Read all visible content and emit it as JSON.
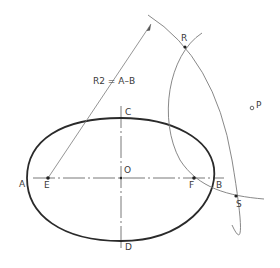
{
  "diagram": {
    "type": "ellipse-construction",
    "colors": {
      "ellipse": "#2a2a2a",
      "construction": "#7a7a7a",
      "axis": "#555555",
      "text": "#3a3a3a",
      "background": "#ffffff"
    },
    "labels": {
      "A": "A",
      "B": "B",
      "C": "C",
      "D": "D",
      "E": "E",
      "F": "F",
      "O": "O",
      "P": "P",
      "R": "R",
      "S": "S",
      "radius_note": "R2 = A–B"
    },
    "points": [
      {
        "id": "E",
        "role": "focus"
      },
      {
        "id": "F",
        "role": "focus"
      },
      {
        "id": "O",
        "role": "center"
      },
      {
        "id": "R",
        "role": "arc-intersection"
      },
      {
        "id": "S",
        "role": "arc-intersection"
      },
      {
        "id": "P",
        "role": "external-point"
      }
    ],
    "axes": {
      "major": {
        "from": "A",
        "to": "B"
      },
      "minor": {
        "from": "C",
        "to": "D"
      }
    }
  }
}
